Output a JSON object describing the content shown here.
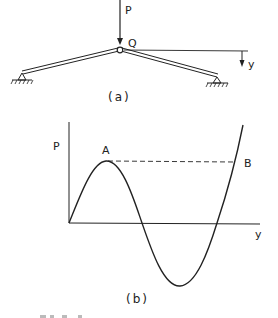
{
  "figure_a": {
    "load_label": "P",
    "node_label": "Q",
    "displacement_label": "y",
    "caption": "(a)"
  },
  "figure_b": {
    "y_axis_label": "P",
    "x_axis_label": "y",
    "point_a_label": "A",
    "point_b_label": "B",
    "caption": "(b)"
  },
  "colors": {
    "ink": "#222222",
    "background": "#ffffff"
  }
}
